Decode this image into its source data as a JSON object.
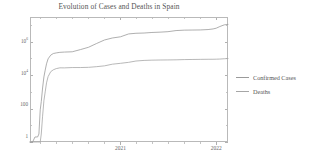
{
  "chart_data": {
    "type": "line",
    "title": "Evolution of Cases and Deaths in Spain",
    "xlabel": "",
    "ylabel": "",
    "yscale": "log",
    "ylim": [
      1,
      30000000
    ],
    "xlim": [
      "2020-01-22",
      "2022-02-15"
    ],
    "grid": false,
    "legend_position": "right",
    "ytick_labels": [
      {
        "text": "10",
        "exp": "6",
        "value": 1000000
      },
      {
        "text": "10",
        "exp": "4",
        "value": 10000
      },
      {
        "text": "100",
        "exp": "",
        "value": 100
      },
      {
        "text": "1",
        "exp": "",
        "value": 1
      }
    ],
    "xtick_labels": [
      {
        "text": "2021",
        "value": "2021-01-01"
      },
      {
        "text": "2022",
        "value": "2022-01-01"
      }
    ],
    "series": [
      {
        "name": "Confirmed Cases",
        "color": "#9a9a9a",
        "x": [
          "2020-01-22",
          "2020-02-01",
          "2020-02-10",
          "2020-02-20",
          "2020-02-25",
          "2020-03-01",
          "2020-03-05",
          "2020-03-10",
          "2020-03-15",
          "2020-03-20",
          "2020-03-25",
          "2020-03-31",
          "2020-04-10",
          "2020-04-20",
          "2020-05-01",
          "2020-05-15",
          "2020-06-01",
          "2020-07-01",
          "2020-08-01",
          "2020-09-01",
          "2020-10-01",
          "2020-11-01",
          "2020-12-01",
          "2021-01-01",
          "2021-02-01",
          "2021-03-01",
          "2021-04-01",
          "2021-05-01",
          "2021-06-01",
          "2021-07-01",
          "2021-08-01",
          "2021-09-01",
          "2021-10-01",
          "2021-11-01",
          "2021-12-01",
          "2021-12-20",
          "2022-01-01",
          "2022-01-15",
          "2022-02-01",
          "2022-02-15"
        ],
        "y": [
          1,
          1,
          2,
          2,
          3,
          84,
          259,
          1695,
          7798,
          19980,
          47610,
          94417,
          157022,
          195944,
          213435,
          230698,
          239638,
          248770,
          335602,
          462858,
          769188,
          1264517,
          1665775,
          1958844,
          2913425,
          3188553,
          3300965,
          3559222,
          3720675,
          3971124,
          4627770,
          4903021,
          4977448,
          5048175,
          5321498,
          5787658,
          6422250,
          8086864,
          10202474,
          10780555
        ]
      },
      {
        "name": "Deaths",
        "color": "#a6a6a6",
        "x": [
          "2020-01-22",
          "2020-02-01",
          "2020-02-10",
          "2020-02-20",
          "2020-02-25",
          "2020-03-01",
          "2020-03-05",
          "2020-03-10",
          "2020-03-15",
          "2020-03-20",
          "2020-03-25",
          "2020-03-31",
          "2020-04-10",
          "2020-04-20",
          "2020-05-01",
          "2020-05-15",
          "2020-06-01",
          "2020-07-01",
          "2020-08-01",
          "2020-09-01",
          "2020-10-01",
          "2020-11-01",
          "2020-12-01",
          "2021-01-01",
          "2021-02-01",
          "2021-03-01",
          "2021-04-01",
          "2021-05-01",
          "2021-06-01",
          "2021-07-01",
          "2021-08-01",
          "2021-09-01",
          "2021-10-01",
          "2021-11-01",
          "2021-12-01",
          "2021-12-20",
          "2022-01-01",
          "2022-01-15",
          "2022-02-01",
          "2022-02-15"
        ],
        "y": [
          0,
          0,
          0,
          0,
          0,
          0,
          3,
          35,
          292,
          1002,
          3434,
          8189,
          16081,
          20852,
          24543,
          27321,
          27127,
          28355,
          28445,
          29234,
          31973,
          35878,
          45069,
          50837,
          58319,
          69801,
          75783,
          78726,
          80196,
          81084,
          82407,
          85066,
          86415,
          87673,
          88708,
          89024,
          89934,
          91599,
          95606,
          98635
        ]
      }
    ],
    "legend": [
      {
        "label": "Confirmed Cases",
        "color": "#9a9a9a"
      },
      {
        "label": "Deaths",
        "color": "#a6a6a6"
      }
    ]
  },
  "axes": {
    "frame_color": "#b9b9b9",
    "tick_color": "#b0b0b0"
  }
}
